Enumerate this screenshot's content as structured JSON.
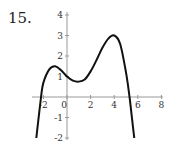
{
  "problem": {
    "number": "15."
  },
  "chart_data": {
    "type": "line",
    "title": "",
    "xlabel": "",
    "ylabel": "",
    "xlim": [
      -3,
      8
    ],
    "ylim": [
      -2,
      4
    ],
    "grid": false,
    "legend": null,
    "x_ticks": [
      -2,
      0,
      2,
      4,
      6,
      8
    ],
    "x_tick_labels": [
      "-2",
      "0",
      "2",
      "4",
      "6",
      "8"
    ],
    "y_ticks": [
      -2,
      -1,
      1,
      2,
      3,
      4
    ],
    "y_tick_labels": [
      "-2",
      "-1",
      "1",
      "2",
      "3",
      "4"
    ],
    "series": [
      {
        "name": "f(x)",
        "color": "#111111",
        "x": [
          -2.6,
          -2.2,
          -2.0,
          -1.5,
          -1.0,
          -0.5,
          0.0,
          0.5,
          1.0,
          1.5,
          2.0,
          2.5,
          3.0,
          3.5,
          4.0,
          4.5,
          5.0,
          5.3,
          5.5,
          5.7
        ],
        "y": [
          -2.0,
          0.0,
          0.7,
          1.35,
          1.5,
          1.3,
          1.0,
          0.8,
          0.75,
          0.85,
          1.25,
          1.8,
          2.4,
          2.85,
          3.0,
          2.6,
          1.2,
          0.0,
          -1.0,
          -2.0
        ]
      }
    ],
    "annotations": {
      "local_max_1": {
        "x": -1,
        "y": 1.5
      },
      "local_min": {
        "x": 1,
        "y": 0.75
      },
      "local_max_2": {
        "x": 4,
        "y": 3
      },
      "roots": [
        -2.2,
        5.3
      ]
    }
  }
}
